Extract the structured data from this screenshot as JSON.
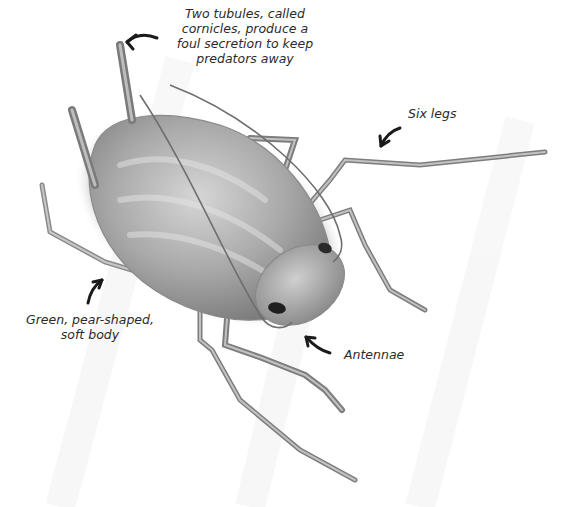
{
  "diagram": {
    "color_scheme": "grayscale",
    "background": "#ffffff",
    "labels": [
      {
        "id": "cornicles",
        "lines": [
          "Two tubules, called",
          "cornicles, produce a",
          "foul secretion to keep",
          "predators away"
        ],
        "arrow": "points-left-to-cornicle-tip"
      },
      {
        "id": "legs",
        "lines": [
          "Six legs"
        ],
        "arrow": "points-down-left-to-leg"
      },
      {
        "id": "body",
        "lines": [
          "Green, pear-shaped,",
          "soft body"
        ],
        "arrow": "points-up-right-to-body"
      },
      {
        "id": "antennae",
        "lines": [
          "Antennae"
        ],
        "arrow": "points-up-left-to-antenna-base"
      }
    ]
  }
}
